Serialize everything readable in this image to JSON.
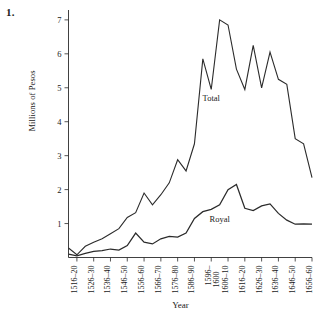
{
  "figure": {
    "number_label": "1."
  },
  "chart_data": {
    "type": "line",
    "title": "",
    "xlabel": "Year",
    "ylabel": "Millions of Pesos",
    "grid": false,
    "legend_position": "inline-annotation",
    "ylim": [
      0,
      7.35
    ],
    "yticks": [
      1,
      2,
      3,
      4,
      5,
      6,
      7
    ],
    "ytick_labels": [
      "1",
      "2",
      "3",
      "4",
      "5",
      "6",
      "7"
    ],
    "xtick_labels": [
      "1516–20",
      "1526–30",
      "1536–40",
      "1546–50",
      "1556–60",
      "1566–70",
      "1576–80",
      "1586–90",
      "1596–",
      "1606–10",
      "1616–20",
      "1626–30",
      "1636–40",
      "1646–50",
      "1656–60"
    ],
    "xtick_label_extra": "1600",
    "xtick_label_extra_index": 8,
    "x_periods": [
      "1511–15",
      "1516–20",
      "1521–25",
      "1526–30",
      "1531–35",
      "1536–40",
      "1541–45",
      "1546–50",
      "1551–55",
      "1556–60",
      "1561–65",
      "1566–70",
      "1571–75",
      "1576–80",
      "1581–85",
      "1586–90",
      "1591–95",
      "1596–1600",
      "1601–05",
      "1606–10",
      "1611–15",
      "1616–20",
      "1621–25",
      "1626–30",
      "1631–35",
      "1636–40",
      "1641–45",
      "1646–50",
      "1651–55",
      "1656–60"
    ],
    "series": [
      {
        "name": "Total",
        "label": "Total",
        "color": "#2b2b2b",
        "values": [
          0.28,
          0.08,
          0.33,
          0.45,
          0.55,
          0.7,
          0.85,
          1.18,
          1.32,
          1.9,
          1.55,
          1.85,
          2.2,
          2.88,
          2.55,
          3.35,
          5.85,
          4.95,
          7.0,
          6.85,
          5.55,
          4.95,
          6.25,
          5.0,
          6.05,
          5.25,
          5.1,
          3.5,
          3.35,
          2.35
        ]
      },
      {
        "name": "Royal",
        "label": "Royal",
        "color": "#2b2b2b",
        "values": [
          0.1,
          0.05,
          0.12,
          0.18,
          0.2,
          0.25,
          0.22,
          0.35,
          0.72,
          0.45,
          0.4,
          0.55,
          0.62,
          0.6,
          0.72,
          1.15,
          1.35,
          1.42,
          1.55,
          2.0,
          2.15,
          1.45,
          1.38,
          1.52,
          1.58,
          1.3,
          1.1,
          0.98,
          0.99,
          0.98
        ]
      }
    ],
    "series_extension_note": "",
    "annotations": [
      {
        "text": "Total",
        "x_period": "1596–1600",
        "value": 4.6
      },
      {
        "text": "Royal",
        "x_period": "1601–05",
        "value": 1.05
      }
    ]
  }
}
